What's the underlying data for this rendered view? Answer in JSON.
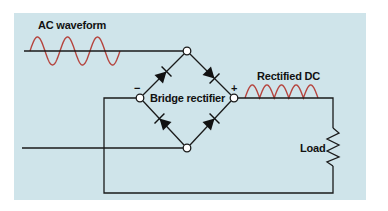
{
  "diagram": {
    "labels": {
      "ac_waveform": "AC waveform",
      "bridge_rectifier": "Bridge rectifier",
      "rectified_dc": "Rectified DC",
      "load": "Load",
      "negative_terminal": "−",
      "positive_terminal": "+"
    },
    "colors": {
      "background_panel": "#cfe4ea",
      "wire": "#1a1a1a",
      "waveform": "#b5443e"
    },
    "components": [
      {
        "type": "ac-source-wave",
        "cycles": 3
      },
      {
        "type": "diode",
        "position": "top-left"
      },
      {
        "type": "diode",
        "position": "top-right"
      },
      {
        "type": "diode",
        "position": "bottom-left"
      },
      {
        "type": "diode",
        "position": "bottom-right"
      },
      {
        "type": "resistor",
        "name": "Load"
      },
      {
        "type": "rectified-wave",
        "humps": 5
      }
    ]
  }
}
